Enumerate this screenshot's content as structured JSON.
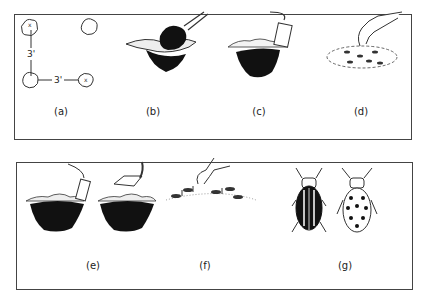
{
  "panels": [
    {
      "id": "top",
      "figures": [
        {
          "id": "a",
          "label": "(a)",
          "description": "Planting layout: hills spaced 3 feet apart",
          "dimensions": [
            "3'",
            "3'"
          ]
        },
        {
          "id": "b",
          "label": "(b)",
          "description": "Digging a hole with a trowel"
        },
        {
          "id": "c",
          "label": "(c)",
          "description": "Filling hole with soil"
        },
        {
          "id": "d",
          "label": "(d)",
          "description": "Hand placing seeds in a circle"
        }
      ]
    },
    {
      "id": "bottom",
      "figures": [
        {
          "id": "e",
          "label": "(e)",
          "description": "Covering seeds and firming soil with trowel"
        },
        {
          "id": "f",
          "label": "(f)",
          "description": "Thinning seedlings by hand"
        },
        {
          "id": "g",
          "label": "(g)",
          "description": "Striped and spotted cucumber beetles"
        }
      ]
    }
  ]
}
